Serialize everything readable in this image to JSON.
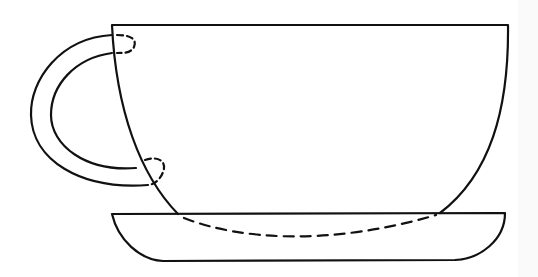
{
  "illustration": {
    "subject": "teacup-and-saucer",
    "style": "black line drawing",
    "stroke_color": "#111111",
    "background_color": "#ffffff",
    "parts": [
      "cup-body",
      "cup-handle",
      "saucer",
      "hidden-cup-bottom-dashed",
      "hidden-handle-joints-dashed"
    ]
  }
}
